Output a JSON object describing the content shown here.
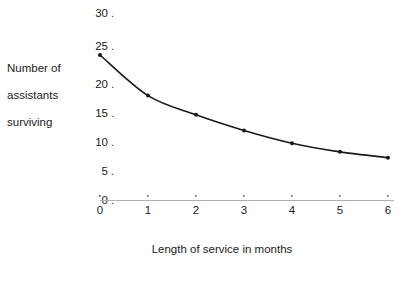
{
  "chart_data": {
    "type": "line",
    "title": "",
    "xlabel": "Length of service in months",
    "ylabel": "Number of assistants surviving",
    "ylabel_lines": [
      "Number of",
      "assistants",
      "surviving"
    ],
    "x": [
      0,
      1,
      2,
      3,
      4,
      5,
      6
    ],
    "values": [
      25,
      18,
      14.7,
      12,
      9.8,
      8.3,
      7.3
    ],
    "series": [
      {
        "name": "Number of assistants surviving",
        "values": [
          25,
          18,
          14.7,
          12,
          9.8,
          8.3,
          7.3
        ]
      }
    ],
    "xtick_labels": [
      "0",
      "1",
      "2",
      "3",
      "4",
      "5",
      "6"
    ],
    "ytick_labels": [
      "0",
      "5",
      "10",
      "15",
      "20",
      "25",
      "30"
    ],
    "ytick_values": [
      0,
      5,
      10,
      15,
      20,
      25,
      30
    ],
    "xlim": [
      0,
      6
    ],
    "ylim": [
      0,
      30
    ],
    "grid": false,
    "legend": false,
    "legend_position": "none",
    "marker": "dot",
    "line_color": "#1a1a1a",
    "marker_color": "#1a1a1a",
    "axis_color": "#b0b0b0",
    "background_color": "#ffffff",
    "tick_dot_symbol": "."
  }
}
